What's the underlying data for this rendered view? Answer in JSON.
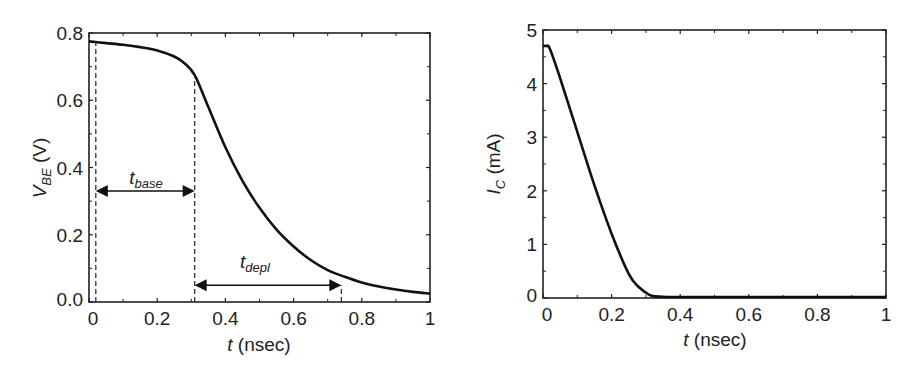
{
  "chart_data": [
    {
      "type": "line",
      "title": "",
      "xlabel": "t (nsec)",
      "ylabel": "V_BE (V)",
      "xlim": [
        0,
        1
      ],
      "ylim": [
        0,
        0.8
      ],
      "xticks": [
        "0",
        "0.2",
        "0.4",
        "0.6",
        "0.8",
        "1"
      ],
      "yticks": [
        "0.0",
        "0.2",
        "0.4",
        "0.6",
        "0.8"
      ],
      "grid": false,
      "series": [
        {
          "name": "V_BE",
          "x": [
            0,
            0.05,
            0.1,
            0.15,
            0.2,
            0.25,
            0.28,
            0.31,
            0.35,
            0.4,
            0.45,
            0.5,
            0.55,
            0.6,
            0.65,
            0.7,
            0.75,
            0.8,
            0.85,
            0.9,
            0.95,
            1.0
          ],
          "y": [
            0.775,
            0.77,
            0.765,
            0.758,
            0.748,
            0.73,
            0.71,
            0.675,
            0.58,
            0.46,
            0.36,
            0.28,
            0.215,
            0.165,
            0.125,
            0.095,
            0.075,
            0.058,
            0.046,
            0.037,
            0.03,
            0.025
          ]
        }
      ],
      "annotations": [
        {
          "label": "t_base",
          "from": 0.02,
          "to": 0.31,
          "y": 0.33
        },
        {
          "label": "t_depl",
          "from": 0.31,
          "to": 0.74,
          "y": 0.05
        }
      ],
      "dashed_verticals": [
        0.02,
        0.31,
        0.74
      ]
    },
    {
      "type": "line",
      "title": "",
      "xlabel": "t (nsec)",
      "ylabel": "I_C (mA)",
      "xlim": [
        0,
        1
      ],
      "ylim": [
        0,
        5
      ],
      "xticks": [
        "0",
        "0.2",
        "0.4",
        "0.6",
        "0.8",
        "1"
      ],
      "yticks": [
        "0",
        "1",
        "2",
        "3",
        "4",
        "5"
      ],
      "grid": false,
      "series": [
        {
          "name": "I_C",
          "x": [
            0,
            0.01,
            0.02,
            0.05,
            0.1,
            0.15,
            0.2,
            0.25,
            0.28,
            0.31,
            0.33,
            0.36,
            0.4,
            0.6,
            0.8,
            1.0
          ],
          "y": [
            4.7,
            4.7,
            4.65,
            4.1,
            3.1,
            2.1,
            1.2,
            0.45,
            0.2,
            0.06,
            0.03,
            0.02,
            0.02,
            0.02,
            0.02,
            0.02
          ]
        }
      ]
    }
  ],
  "labels": {
    "left_ylabel_main": "V",
    "left_ylabel_sub": "BE",
    "left_ylabel_unit": " (V)",
    "right_ylabel_main": "I",
    "right_ylabel_sub": "C",
    "right_ylabel_unit": " (mA)",
    "xlabel_var": "t",
    "xlabel_unit": " (nsec)",
    "tbase_main": "t",
    "tbase_sub": "base",
    "tdepl_main": "t",
    "tdepl_sub": "depl"
  }
}
